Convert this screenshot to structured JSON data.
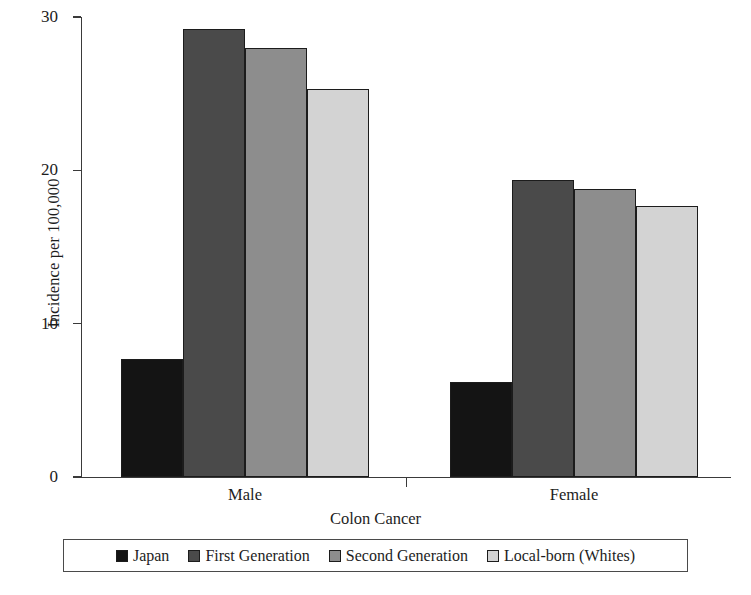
{
  "chart_data": {
    "type": "bar",
    "title": "",
    "xlabel": "Colon Cancer",
    "ylabel": "Incidence per 100,000",
    "categories": [
      "Male",
      "Female"
    ],
    "series": [
      {
        "name": "Japan",
        "color": "#141414",
        "values": [
          7.7,
          6.2
        ]
      },
      {
        "name": "First Generation",
        "color": "#4a4a4a",
        "values": [
          29.2,
          19.4
        ]
      },
      {
        "name": "Second Generation",
        "color": "#8d8d8d",
        "values": [
          28.0,
          18.8
        ]
      },
      {
        "name": "Local-born (Whites)",
        "color": "#d3d3d3",
        "values": [
          25.3,
          17.7
        ]
      }
    ],
    "ylim": [
      0,
      30
    ],
    "yticks": [
      0,
      10,
      20,
      30
    ],
    "ytick_labels": [
      "0",
      "10",
      "20",
      "30"
    ],
    "grid": false,
    "legend_position": "bottom"
  },
  "axis": {
    "y_title": "Incidence per 100,000",
    "x_title": "Colon Cancer"
  }
}
